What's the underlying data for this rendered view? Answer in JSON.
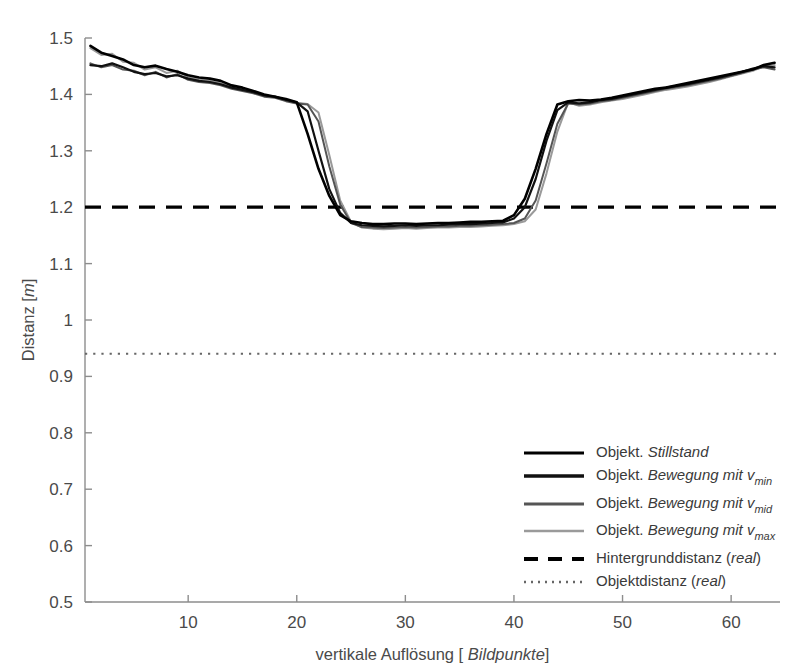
{
  "chart_data": {
    "type": "line",
    "title": "",
    "xlabel": "vertikale Auflösung [ Bildpunkte]",
    "xlabel_plain": "vertikale Auflösung [",
    "xlabel_italic": "Bildpunkte",
    "xlabel_tail": "]",
    "ylabel": "Distanz [m]",
    "ylabel_plain": "Distanz [",
    "ylabel_italic": "m",
    "ylabel_tail": "]",
    "xlim": [
      0.5,
      64.5
    ],
    "ylim": [
      0.5,
      1.5
    ],
    "xticks": [
      10,
      20,
      30,
      40,
      50,
      60
    ],
    "xticklabels": [
      "10",
      "20",
      "30",
      "40",
      "50",
      "60"
    ],
    "yticks": [
      0.5,
      0.6,
      0.7,
      0.8,
      0.9,
      1.0,
      1.1,
      1.2,
      1.3,
      1.4,
      1.5
    ],
    "yticklabels": [
      "0.5",
      "0.6",
      "0.7",
      "0.8",
      "0.9",
      "1",
      "1.1",
      "1.2",
      "1.3",
      "1.4",
      "1.5"
    ],
    "grid": false,
    "legend_position": "lower right",
    "series": [
      {
        "name": "Objekt. Stillstand",
        "style": "solid",
        "color": "#000000",
        "width": 2.6,
        "x": [
          1,
          2,
          3,
          4,
          5,
          6,
          7,
          8,
          9,
          10,
          11,
          12,
          13,
          14,
          15,
          16,
          17,
          18,
          19,
          20,
          21,
          22,
          23,
          24,
          25,
          26,
          27,
          28,
          29,
          30,
          31,
          32,
          33,
          34,
          35,
          36,
          37,
          38,
          39,
          40,
          41,
          42,
          43,
          44,
          45,
          46,
          47,
          48,
          49,
          50,
          51,
          52,
          53,
          54,
          55,
          56,
          57,
          58,
          59,
          60,
          61,
          62,
          63,
          64
        ],
        "y": [
          1.486,
          1.474,
          1.468,
          1.462,
          1.452,
          1.448,
          1.451,
          1.445,
          1.44,
          1.434,
          1.43,
          1.428,
          1.424,
          1.416,
          1.412,
          1.406,
          1.4,
          1.396,
          1.392,
          1.386,
          1.33,
          1.268,
          1.22,
          1.186,
          1.175,
          1.172,
          1.17,
          1.17,
          1.171,
          1.171,
          1.17,
          1.171,
          1.172,
          1.172,
          1.173,
          1.174,
          1.174,
          1.175,
          1.176,
          1.186,
          1.215,
          1.268,
          1.33,
          1.382,
          1.388,
          1.39,
          1.389,
          1.391,
          1.394,
          1.398,
          1.402,
          1.406,
          1.41,
          1.412,
          1.416,
          1.42,
          1.424,
          1.428,
          1.432,
          1.436,
          1.44,
          1.444,
          1.452,
          1.456
        ]
      },
      {
        "name": "Objekt. Bewegung mit v_min",
        "style": "solid",
        "color": "#111111",
        "width": 2.2,
        "x": [
          1,
          2,
          3,
          4,
          5,
          6,
          7,
          8,
          9,
          10,
          11,
          12,
          13,
          14,
          15,
          16,
          17,
          18,
          19,
          20,
          21,
          22,
          23,
          24,
          25,
          26,
          27,
          28,
          29,
          30,
          31,
          32,
          33,
          34,
          35,
          36,
          37,
          38,
          39,
          40,
          41,
          42,
          43,
          44,
          45,
          46,
          47,
          48,
          49,
          50,
          51,
          52,
          53,
          54,
          55,
          56,
          57,
          58,
          59,
          60,
          61,
          62,
          63,
          64
        ],
        "y": [
          1.452,
          1.45,
          1.455,
          1.448,
          1.44,
          1.436,
          1.438,
          1.432,
          1.434,
          1.428,
          1.424,
          1.422,
          1.418,
          1.412,
          1.408,
          1.404,
          1.398,
          1.396,
          1.39,
          1.386,
          1.37,
          1.3,
          1.232,
          1.19,
          1.172,
          1.168,
          1.167,
          1.166,
          1.167,
          1.168,
          1.167,
          1.168,
          1.168,
          1.169,
          1.17,
          1.17,
          1.171,
          1.172,
          1.173,
          1.18,
          1.2,
          1.25,
          1.318,
          1.372,
          1.386,
          1.384,
          1.386,
          1.39,
          1.392,
          1.396,
          1.4,
          1.404,
          1.408,
          1.412,
          1.415,
          1.418,
          1.422,
          1.426,
          1.43,
          1.435,
          1.44,
          1.446,
          1.45,
          1.448
        ]
      },
      {
        "name": "Objekt. Bewegung mit v_mid",
        "style": "solid",
        "color": "#555555",
        "width": 2.0,
        "x": [
          1,
          2,
          3,
          4,
          5,
          6,
          7,
          8,
          9,
          10,
          11,
          12,
          13,
          14,
          15,
          16,
          17,
          18,
          19,
          20,
          21,
          22,
          23,
          24,
          25,
          26,
          27,
          28,
          29,
          30,
          31,
          32,
          33,
          34,
          35,
          36,
          37,
          38,
          39,
          40,
          41,
          42,
          43,
          44,
          45,
          46,
          47,
          48,
          49,
          50,
          51,
          52,
          53,
          54,
          55,
          56,
          57,
          58,
          59,
          60,
          61,
          62,
          63,
          64
        ],
        "y": [
          1.455,
          1.448,
          1.452,
          1.444,
          1.442,
          1.434,
          1.44,
          1.43,
          1.436,
          1.426,
          1.422,
          1.42,
          1.416,
          1.41,
          1.406,
          1.402,
          1.396,
          1.394,
          1.388,
          1.384,
          1.382,
          1.352,
          1.272,
          1.205,
          1.172,
          1.165,
          1.164,
          1.163,
          1.164,
          1.165,
          1.164,
          1.165,
          1.166,
          1.166,
          1.167,
          1.167,
          1.168,
          1.169,
          1.17,
          1.172,
          1.18,
          1.212,
          1.278,
          1.348,
          1.384,
          1.382,
          1.384,
          1.388,
          1.39,
          1.394,
          1.398,
          1.402,
          1.406,
          1.41,
          1.413,
          1.416,
          1.42,
          1.424,
          1.428,
          1.433,
          1.438,
          1.444,
          1.448,
          1.444
        ]
      },
      {
        "name": "Objekt. Bewegung mit v_max",
        "style": "solid",
        "color": "#9a9a9a",
        "width": 2.0,
        "x": [
          1,
          2,
          3,
          4,
          5,
          6,
          7,
          8,
          9,
          10,
          11,
          12,
          13,
          14,
          15,
          16,
          17,
          18,
          19,
          20,
          21,
          22,
          23,
          24,
          25,
          26,
          27,
          28,
          29,
          30,
          31,
          32,
          33,
          34,
          35,
          36,
          37,
          38,
          39,
          40,
          41,
          42,
          43,
          44,
          45,
          46,
          47,
          48,
          49,
          50,
          51,
          52,
          53,
          54,
          55,
          56,
          57,
          58,
          59,
          60,
          61,
          62,
          63,
          64
        ],
        "y": [
          1.482,
          1.47,
          1.472,
          1.458,
          1.456,
          1.444,
          1.448,
          1.438,
          1.442,
          1.43,
          1.426,
          1.424,
          1.42,
          1.414,
          1.408,
          1.404,
          1.398,
          1.395,
          1.389,
          1.385,
          1.383,
          1.368,
          1.292,
          1.212,
          1.174,
          1.164,
          1.162,
          1.161,
          1.162,
          1.163,
          1.162,
          1.163,
          1.164,
          1.164,
          1.165,
          1.165,
          1.166,
          1.167,
          1.168,
          1.17,
          1.175,
          1.196,
          1.26,
          1.334,
          1.386,
          1.38,
          1.382,
          1.386,
          1.389,
          1.392,
          1.396,
          1.4,
          1.404,
          1.408,
          1.411,
          1.414,
          1.418,
          1.422,
          1.427,
          1.432,
          1.437,
          1.442,
          1.45,
          1.452
        ]
      }
    ],
    "reference_lines": [
      {
        "name": "Hintergrunddistanz (real)",
        "value": 1.2,
        "style": "dashed",
        "color": "#000000",
        "width": 3.2
      },
      {
        "name": "Objektdistanz (real)",
        "value": 0.94,
        "style": "dotted",
        "color": "#666666",
        "width": 2.0
      }
    ]
  },
  "legend": {
    "items": [
      {
        "prefix": "Objekt.",
        "main": "Stillstand",
        "sub": "",
        "sample": "solid-black-thick",
        "color": "#000000"
      },
      {
        "prefix": "Objekt.",
        "main": "Bewegung mit v",
        "sub": "min",
        "sample": "solid-black",
        "color": "#111111"
      },
      {
        "prefix": "Objekt.",
        "main": "Bewegung mit v",
        "sub": "mid",
        "sample": "solid-darkgray",
        "color": "#555555"
      },
      {
        "prefix": "Objekt.",
        "main": "Bewegung mit v",
        "sub": "max",
        "sample": "solid-lightgray",
        "color": "#9a9a9a"
      },
      {
        "prefix": "",
        "main": "Hintergrunddistanz (",
        "sub": "",
        "italic_tail": "real",
        "close": ")",
        "sample": "dashed-black",
        "color": "#000000"
      },
      {
        "prefix": "",
        "main": "Objektdistanz (",
        "sub": "",
        "italic_tail": "real",
        "close": ")",
        "sample": "dotted-gray",
        "color": "#666666"
      }
    ]
  }
}
